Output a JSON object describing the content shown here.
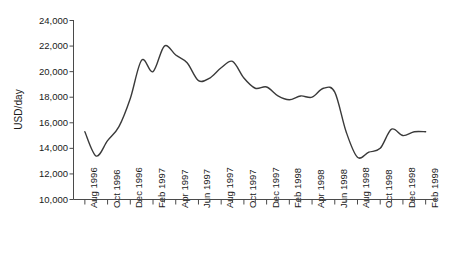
{
  "chart_data": {
    "type": "line",
    "title": "",
    "xlabel": "",
    "ylabel": "USD/day",
    "ylim": [
      10000,
      24000
    ],
    "ytick_values": [
      10000,
      12000,
      14000,
      16000,
      18000,
      20000,
      22000,
      24000
    ],
    "ytick_labels": [
      "10,000",
      "12,000",
      "14,000",
      "16,000",
      "18,000",
      "20,000",
      "22,000",
      "24,000"
    ],
    "xlim": [
      "Aug 1996",
      "Feb 1999"
    ],
    "xtick_labels": [
      "Aug 1996",
      "Oct 1996",
      "Dec 1996",
      "Feb 1997",
      "Apr 1997",
      "Jun 1997",
      "Aug 1997",
      "Oct 1997",
      "Dec 1997",
      "Feb 1998",
      "Apr 1998",
      "Jun 1998",
      "Aug 1998",
      "Oct 1998",
      "Dec 1998",
      "Feb 1999"
    ],
    "xtick_minor_count": 31,
    "grid": false,
    "legend": null,
    "line_color": "#3a3a3a",
    "line_width": 1.4,
    "x": [
      "Aug 1996",
      "Sep 1996",
      "Oct 1996",
      "Nov 1996",
      "Dec 1996",
      "Jan 1997",
      "Feb 1997",
      "Mar 1997",
      "Apr 1997",
      "May 1997",
      "Jun 1997",
      "Jul 1997",
      "Aug 1997",
      "Sep 1997",
      "Oct 1997",
      "Nov 1997",
      "Dec 1997",
      "Jan 1998",
      "Feb 1998",
      "Mar 1998",
      "Apr 1998",
      "May 1998",
      "Jun 1998",
      "Jul 1998",
      "Aug 1998",
      "Sep 1998",
      "Oct 1998",
      "Nov 1998",
      "Dec 1998",
      "Jan 1999",
      "Feb 1999"
    ],
    "values": [
      15300,
      13400,
      14600,
      15700,
      17900,
      20900,
      20000,
      22000,
      21300,
      20700,
      19300,
      19500,
      20300,
      20800,
      19500,
      18700,
      18800,
      18100,
      17800,
      18100,
      18000,
      18700,
      18400,
      15300,
      13300,
      13700,
      14000,
      15500,
      15000,
      15300,
      15300
    ],
    "series_name": "Rate"
  }
}
